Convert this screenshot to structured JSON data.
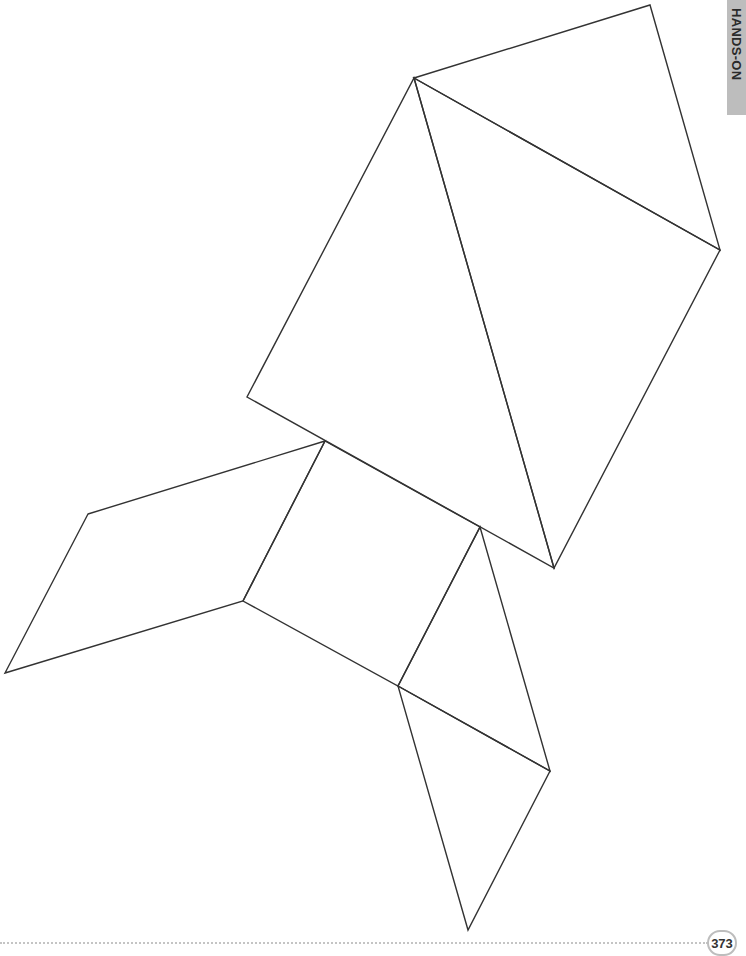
{
  "side_tab": {
    "label": "HANDS-ON",
    "background": "#bdbdbd"
  },
  "footer": {
    "page_number": "373"
  },
  "figure": {
    "stroke_color": "#333333",
    "pieces": [
      {
        "name": "large-triangle-top",
        "points": "414,78 650,5 720,250"
      },
      {
        "name": "large-triangle-left",
        "points": "414,78 720,250 554,568"
      },
      {
        "name": "body-quad",
        "points": "414,78 554,568 247,397"
      },
      {
        "name": "square-center",
        "points": "325,441 480,527 398,686 243,601"
      },
      {
        "name": "parallelogram-left",
        "points": "88,514 325,441 243,601 5,673"
      },
      {
        "name": "triangle-lower-right",
        "points": "480,527 550,771 398,686"
      },
      {
        "name": "triangle-bottom",
        "points": "398,686 550,771 468,930"
      }
    ]
  }
}
